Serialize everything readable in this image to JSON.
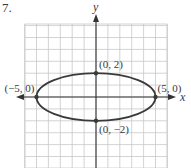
{
  "problem": {
    "number": "7."
  },
  "chart_data": {
    "type": "line",
    "title": "",
    "xlabel": "x",
    "ylabel": "y",
    "xlim": [
      -6,
      6
    ],
    "ylim": [
      -6,
      6
    ],
    "grid": true,
    "grid_step": 1,
    "curve": {
      "shape": "ellipse",
      "center": [
        0,
        0
      ],
      "semi_major_x": 5,
      "semi_minor_y": 2,
      "equation": "x^2/25 + y^2/4 = 1"
    },
    "points": [
      {
        "x": 0,
        "y": 2,
        "label": "(0, 2)"
      },
      {
        "x": 0,
        "y": -2,
        "label": "(0, −2)"
      },
      {
        "x": -5,
        "y": 0,
        "label": "(−5, 0)"
      },
      {
        "x": 5,
        "y": 0,
        "label": "(5, 0)"
      }
    ]
  },
  "colors": {
    "grid": "#c8c8c8",
    "axis": "#333333",
    "curve": "#3a3a3a",
    "text": "#3a3a3a"
  }
}
